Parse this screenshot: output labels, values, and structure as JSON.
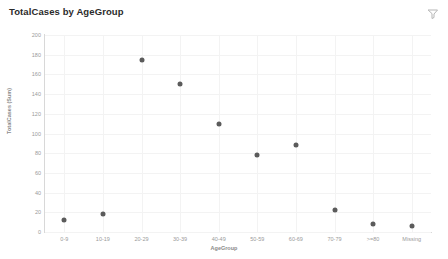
{
  "header": {
    "title": "TotalCases by AgeGroup",
    "filter_icon": "filter-funnel-icon"
  },
  "chart_data": {
    "type": "scatter",
    "title": "TotalCases by AgeGroup",
    "xlabel": "AgeGroup",
    "ylabel": "TotalCases (Sum)",
    "categories": [
      "0-9",
      "10-19",
      "20-29",
      "30-39",
      "40-49",
      "50-59",
      "60-69",
      "70-79",
      ">=80",
      "Missing"
    ],
    "values": [
      12,
      18,
      175,
      150,
      110,
      78,
      88,
      22,
      8,
      6
    ],
    "ylim": [
      0,
      200
    ],
    "yticks": [
      0,
      20,
      40,
      60,
      80,
      100,
      120,
      140,
      160,
      180,
      200
    ],
    "ytick_labels": [
      "0",
      "20",
      "40",
      "60",
      "80",
      "100",
      "120",
      "140",
      "160",
      "180",
      "200"
    ],
    "grid": true,
    "legend": false,
    "marker_color": "#5b5b5b"
  },
  "colors": {
    "marker": "#5b5b5b",
    "grid": "#f3f3f3",
    "axis": "#d8d8d8",
    "tick_text": "#9a9a9a",
    "title_text": "#2b2b2b"
  }
}
